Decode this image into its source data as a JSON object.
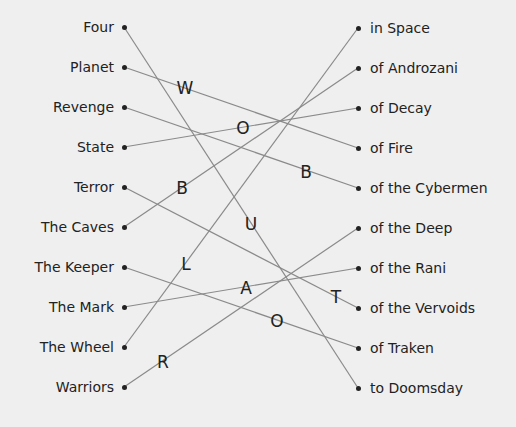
{
  "puzzle": {
    "left_items": [
      {
        "label": "Four",
        "y": 27
      },
      {
        "label": "Planet",
        "y": 67
      },
      {
        "label": "Revenge",
        "y": 107
      },
      {
        "label": "State",
        "y": 147
      },
      {
        "label": "Terror",
        "y": 187
      },
      {
        "label": "The Caves",
        "y": 227
      },
      {
        "label": "The Keeper",
        "y": 267
      },
      {
        "label": "The Mark",
        "y": 307
      },
      {
        "label": "The Wheel",
        "y": 347
      },
      {
        "label": "Warriors",
        "y": 387
      }
    ],
    "right_items": [
      {
        "label": "in Space",
        "y": 28
      },
      {
        "label": "of Androzani",
        "y": 68
      },
      {
        "label": "of Decay",
        "y": 108
      },
      {
        "label": "of Fire",
        "y": 148
      },
      {
        "label": "of the Cybermen",
        "y": 188
      },
      {
        "label": "of the Deep",
        "y": 228
      },
      {
        "label": "of the Rani",
        "y": 268
      },
      {
        "label": "of the Vervoids",
        "y": 308
      },
      {
        "label": "of Traken",
        "y": 348
      },
      {
        "label": "to Doomsday",
        "y": 388
      }
    ],
    "connections": [
      {
        "from": "Four",
        "to": "to Doomsday"
      },
      {
        "from": "Planet",
        "to": "of Fire"
      },
      {
        "from": "Revenge",
        "to": "of the Cybermen"
      },
      {
        "from": "State",
        "to": "of Decay"
      },
      {
        "from": "Terror",
        "to": "of the Vervoids"
      },
      {
        "from": "The Caves",
        "to": "of Androzani"
      },
      {
        "from": "The Keeper",
        "to": "of Traken"
      },
      {
        "from": "The Mark",
        "to": "of the Rani"
      },
      {
        "from": "The Wheel",
        "to": "in Space"
      },
      {
        "from": "Warriors",
        "to": "of the Deep"
      }
    ],
    "letters": [
      {
        "char": "W",
        "x": 185,
        "y": 88
      },
      {
        "char": "O",
        "x": 243,
        "y": 128
      },
      {
        "char": "B",
        "x": 182,
        "y": 188
      },
      {
        "char": "B",
        "x": 306,
        "y": 172
      },
      {
        "char": "U",
        "x": 251,
        "y": 224
      },
      {
        "char": "L",
        "x": 186,
        "y": 264
      },
      {
        "char": "A",
        "x": 246,
        "y": 288
      },
      {
        "char": "T",
        "x": 336,
        "y": 297
      },
      {
        "char": "O",
        "x": 277,
        "y": 321
      },
      {
        "char": "R",
        "x": 163,
        "y": 362
      }
    ],
    "colors": {
      "background": "#efefef",
      "text": "#222222",
      "line": "#8a8a8a"
    }
  }
}
